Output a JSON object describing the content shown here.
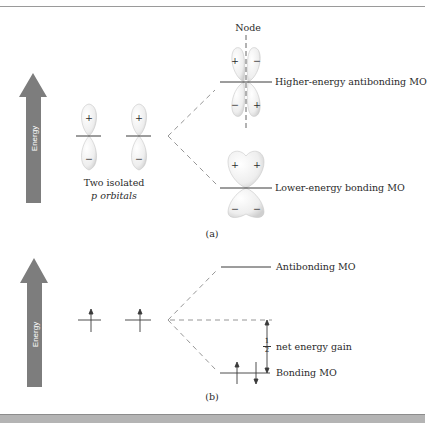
{
  "panel_a": {
    "energy_label": "Energy",
    "node_label": "Node",
    "isolated_label_line1": "Two isolated",
    "isolated_label_line2": "p orbitals",
    "antibonding_label": "Higher-energy antibonding MO",
    "bonding_label": "Lower-energy bonding MO",
    "caption": "(a)",
    "signs": {
      "isolated_top": "+",
      "isolated_bottom": "−",
      "anti_top_left": "+",
      "anti_top_right": "−",
      "anti_bottom_left": "−",
      "anti_bottom_right": "+",
      "bond_top_left": "+",
      "bond_top_right": "+",
      "bond_bottom_left": "−",
      "bond_bottom_right": "−"
    }
  },
  "panel_b": {
    "energy_label": "Energy",
    "antibonding_label": "Antibonding MO",
    "bonding_label": "Bonding MO",
    "gain_fraction_num": "1",
    "gain_fraction_den": "2",
    "gain_label": "net energy gain",
    "caption": "(b)"
  },
  "colors": {
    "arrow": "#7d7d7d",
    "line": "#3a3a3a",
    "dash": "#8a8a8a",
    "lobe": "#e6e6e6"
  }
}
